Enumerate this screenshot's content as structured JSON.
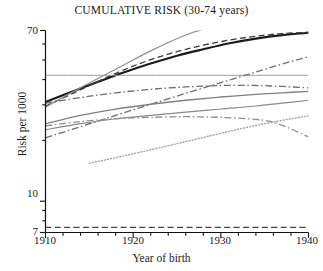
{
  "chart_data": {
    "type": "line",
    "title": "CUMULATIVE RISK (30-74 years)",
    "xlabel": "Year of birth",
    "ylabel": "Risk per 1000",
    "xlim": [
      1910,
      1940
    ],
    "ylim": [
      7,
      70
    ],
    "yscale": "log",
    "grid": false,
    "legend": "none",
    "xticks": [
      1910,
      1920,
      1930,
      1940
    ],
    "xtick_labels": [
      "1910",
      "1920",
      "1930",
      "1940"
    ],
    "xminor_ticks": [
      1912,
      1914,
      1916,
      1918,
      1922,
      1924,
      1926,
      1928,
      1932,
      1934,
      1936,
      1938
    ],
    "yticks": [
      7,
      10,
      70
    ],
    "ytick_labels": [
      "7",
      "10",
      "70"
    ],
    "yminor_ticks": [
      8,
      9,
      20,
      30,
      40,
      50,
      60
    ],
    "series": [
      {
        "name": "thick-black-solid",
        "color": "#1b1b1b",
        "style": "solid",
        "width": 2.1,
        "x": [
          1910,
          1913,
          1916,
          1919,
          1922,
          1925,
          1928,
          1931,
          1934,
          1937,
          1940
        ],
        "y": [
          31.0,
          34.8,
          39.0,
          43.5,
          48.0,
          52.5,
          56.5,
          60.5,
          63.8,
          66.4,
          68.2
        ]
      },
      {
        "name": "black-dashed",
        "color": "#3a3a3a",
        "style": "dashed",
        "width": 1.3,
        "x": [
          1910,
          1913,
          1916,
          1919,
          1922,
          1925,
          1928,
          1931,
          1934,
          1937,
          1940
        ],
        "y": [
          29.6,
          34.0,
          39.2,
          44.8,
          50.2,
          55.0,
          59.2,
          62.8,
          65.6,
          67.6,
          68.6
        ]
      },
      {
        "name": "steep-gray-solid",
        "color": "#8f8f8f",
        "style": "solid",
        "width": 1.2,
        "x": [
          1910,
          1914,
          1918,
          1922,
          1926,
          1928.5
        ],
        "y": [
          29.2,
          36.5,
          45.0,
          55.5,
          66.5,
          72.0
        ]
      },
      {
        "name": "flat-gray-horizontal",
        "color": "#9a9a9a",
        "style": "solid",
        "width": 1.0,
        "x": [
          1910,
          1940
        ],
        "y": [
          42.0,
          42.0
        ]
      },
      {
        "name": "gray-dashdot-rising",
        "color": "#6e6e6e",
        "style": "dashdot",
        "width": 1.3,
        "x": [
          1910,
          1914,
          1918,
          1922,
          1926,
          1930,
          1934,
          1937,
          1940
        ],
        "y": [
          20.6,
          23.4,
          26.6,
          30.2,
          34.2,
          38.6,
          43.6,
          47.8,
          51.8
        ]
      },
      {
        "name": "gray-dashdot-plateau",
        "color": "#6e6e6e",
        "style": "dashdot",
        "width": 1.3,
        "x": [
          1910,
          1914,
          1918,
          1922,
          1926,
          1930,
          1934,
          1937,
          1940
        ],
        "y": [
          30.6,
          32.6,
          34.4,
          35.8,
          36.8,
          37.4,
          37.4,
          37.0,
          36.4
        ]
      },
      {
        "name": "gray-solid-mid-a",
        "color": "#808080",
        "style": "solid",
        "width": 1.3,
        "x": [
          1910,
          1914,
          1918,
          1922,
          1926,
          1930,
          1934,
          1937,
          1940
        ],
        "y": [
          24.2,
          26.6,
          28.6,
          30.2,
          31.6,
          32.8,
          33.8,
          34.4,
          35.0
        ]
      },
      {
        "name": "gray-solid-mid-b",
        "color": "#8a8a8a",
        "style": "solid",
        "width": 1.2,
        "x": [
          1910,
          1914,
          1918,
          1922,
          1926,
          1930,
          1934,
          1937,
          1940
        ],
        "y": [
          22.6,
          24.2,
          25.6,
          26.6,
          27.6,
          28.6,
          29.6,
          30.6,
          31.6
        ]
      },
      {
        "name": "gray-dashdot-declining",
        "color": "#909090",
        "style": "dashdot",
        "width": 1.3,
        "x": [
          1910,
          1914,
          1918,
          1922,
          1926,
          1930,
          1934,
          1936,
          1938,
          1940
        ],
        "y": [
          23.6,
          24.8,
          25.6,
          26.0,
          26.2,
          26.0,
          25.4,
          24.6,
          22.8,
          20.8
        ]
      },
      {
        "name": "gray-dotted-rising",
        "color": "#a6a6a6",
        "style": "dotted",
        "width": 1.4,
        "x": [
          1915,
          1919,
          1923,
          1927,
          1931,
          1935,
          1938,
          1940
        ],
        "y": [
          15.4,
          16.8,
          18.4,
          20.2,
          22.2,
          24.2,
          25.6,
          26.4
        ]
      },
      {
        "name": "dashed-flat-baseline",
        "color": "#444444",
        "style": "dashed",
        "width": 1.4,
        "x": [
          1910,
          1940
        ],
        "y": [
          7.42,
          7.42
        ]
      }
    ]
  },
  "axis": {
    "y_label_70": "70",
    "y_label_10": "10",
    "y_label_7": "7",
    "x_label_1910": "1910",
    "x_label_1920": "1920",
    "x_label_1930": "1930",
    "x_label_1940": "1940"
  }
}
